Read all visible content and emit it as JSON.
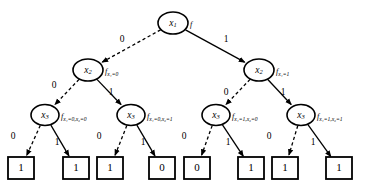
{
  "diagram": {
    "root_function_label": "f",
    "edge_labels": {
      "low": "0",
      "high": "1"
    },
    "edge_styles": {
      "low": "dashed",
      "high": "solid"
    },
    "colors": {
      "stroke": "#000000",
      "fill": "#ffffff",
      "background": "#ffffff"
    },
    "nodes": [
      {
        "id": "n0",
        "level": 0,
        "variable": "x",
        "subscript": "1",
        "fn_base": "f",
        "fn_cond": "",
        "cx": 173,
        "cy": 23,
        "rx": 15,
        "ry": 11
      },
      {
        "id": "n1",
        "level": 1,
        "variable": "x",
        "subscript": "2",
        "fn_base": "f",
        "fn_cond": "x₁=0",
        "cx": 88,
        "cy": 70,
        "rx": 15,
        "ry": 11
      },
      {
        "id": "n2",
        "level": 1,
        "variable": "x",
        "subscript": "2",
        "fn_base": "f",
        "fn_cond": "x₁=1",
        "cx": 259,
        "cy": 70,
        "rx": 15,
        "ry": 11
      },
      {
        "id": "n3",
        "level": 2,
        "variable": "x",
        "subscript": "3",
        "fn_base": "f",
        "fn_cond": "x₁=0,x₂=0",
        "cx": 45,
        "cy": 115,
        "rx": 14,
        "ry": 10.5
      },
      {
        "id": "n4",
        "level": 2,
        "variable": "x",
        "subscript": "3",
        "fn_base": "f",
        "fn_cond": "x₁=0,x₂=1",
        "cx": 131,
        "cy": 115,
        "rx": 14,
        "ry": 10.5
      },
      {
        "id": "n5",
        "level": 2,
        "variable": "x",
        "subscript": "3",
        "fn_base": "f",
        "fn_cond": "x₁=1,x₂=0",
        "cx": 216,
        "cy": 115,
        "rx": 14,
        "ry": 10.5
      },
      {
        "id": "n6",
        "level": 2,
        "variable": "x",
        "subscript": "3",
        "fn_base": "f",
        "fn_cond": "x₁=1,x₂=1",
        "cx": 301,
        "cy": 115,
        "rx": 14,
        "ry": 10.5
      }
    ],
    "leaves": [
      {
        "id": "t0",
        "value": "1",
        "x": 8,
        "y": 157,
        "w": 26,
        "h": 22
      },
      {
        "id": "t1",
        "value": "1",
        "x": 63,
        "y": 157,
        "w": 26,
        "h": 22
      },
      {
        "id": "t2",
        "value": "1",
        "x": 97,
        "y": 157,
        "w": 26,
        "h": 22
      },
      {
        "id": "t3",
        "value": "0",
        "x": 149,
        "y": 157,
        "w": 26,
        "h": 22
      },
      {
        "id": "t4",
        "value": "0",
        "x": 184,
        "y": 157,
        "w": 26,
        "h": 22
      },
      {
        "id": "t5",
        "value": "1",
        "x": 238,
        "y": 157,
        "w": 26,
        "h": 22
      },
      {
        "id": "t6",
        "value": "1",
        "x": 272,
        "y": 157,
        "w": 26,
        "h": 22
      },
      {
        "id": "t7",
        "value": "1",
        "x": 326,
        "y": 157,
        "w": 26,
        "h": 22
      }
    ],
    "edges": [
      {
        "from": "n0",
        "to": "n1",
        "label": "0",
        "style": "dashed",
        "lx": 122,
        "ly": 40
      },
      {
        "from": "n0",
        "to": "n2",
        "label": "1",
        "style": "solid",
        "lx": 226,
        "ly": 40
      },
      {
        "from": "n1",
        "to": "n3",
        "label": "0",
        "style": "dashed",
        "lx": 54,
        "ly": 86
      },
      {
        "from": "n1",
        "to": "n4",
        "label": "1",
        "style": "solid",
        "lx": 111,
        "ly": 93
      },
      {
        "from": "n2",
        "to": "n5",
        "label": "0",
        "style": "dashed",
        "lx": 226,
        "ly": 93
      },
      {
        "from": "n2",
        "to": "n6",
        "label": "1",
        "style": "solid",
        "lx": 283,
        "ly": 93
      },
      {
        "from": "n3",
        "to": "t0",
        "label": "0",
        "style": "dashed",
        "lx": 13,
        "ly": 137
      },
      {
        "from": "n3",
        "to": "t1",
        "label": "1",
        "style": "solid",
        "lx": 57,
        "ly": 143
      },
      {
        "from": "n4",
        "to": "t2",
        "label": "0",
        "style": "dashed",
        "lx": 99,
        "ly": 137
      },
      {
        "from": "n4",
        "to": "t3",
        "label": "1",
        "style": "solid",
        "lx": 143,
        "ly": 143
      },
      {
        "from": "n5",
        "to": "t4",
        "label": "0",
        "style": "dashed",
        "lx": 184,
        "ly": 137
      },
      {
        "from": "n5",
        "to": "t5",
        "label": "1",
        "style": "solid",
        "lx": 228,
        "ly": 143
      },
      {
        "from": "n6",
        "to": "t6",
        "label": "0",
        "style": "dashed",
        "lx": 269,
        "ly": 137
      },
      {
        "from": "n6",
        "to": "t7",
        "label": "1",
        "style": "solid",
        "lx": 313,
        "ly": 143
      }
    ]
  }
}
